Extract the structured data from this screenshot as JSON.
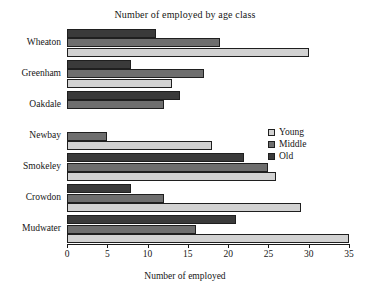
{
  "chart_data": {
    "type": "bar",
    "orientation": "horizontal",
    "title": "Number of employed by age class",
    "xlabel": "Number of employed",
    "ylabel": "",
    "xlim": [
      0,
      35
    ],
    "xticks": [
      0,
      5,
      10,
      15,
      20,
      25,
      30,
      35
    ],
    "grid": false,
    "legend_position": "right-middle",
    "categories": [
      "Wheaton",
      "Greenham",
      "Oakdale",
      "Newbay",
      "Smokeley",
      "Crowdon",
      "Mudwater"
    ],
    "series": [
      {
        "name": "Young",
        "color": "#d2d2d2",
        "values": [
          30,
          13,
          0,
          18,
          26,
          29,
          35
        ]
      },
      {
        "name": "Middle",
        "color": "#6e6e6e",
        "values": [
          19,
          17,
          12,
          5,
          25,
          12,
          16
        ]
      },
      {
        "name": "Old",
        "color": "#3a3a3a",
        "values": [
          11,
          8,
          14,
          0,
          22,
          8,
          21
        ]
      }
    ]
  }
}
